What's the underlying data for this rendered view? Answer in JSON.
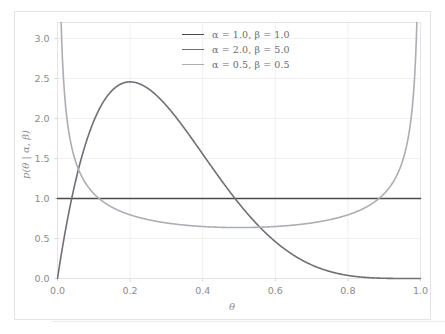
{
  "chart_data": {
    "type": "line",
    "title": "",
    "xlabel": "θ",
    "ylabel": "p(θ | α, β)",
    "xlim": [
      0.0,
      1.0
    ],
    "ylim": [
      0.0,
      3.2
    ],
    "xticks": [
      "0.0",
      "0.2",
      "0.4",
      "0.6",
      "0.8",
      "1.0"
    ],
    "xtick_values": [
      0.0,
      0.2,
      0.4,
      0.6,
      0.8,
      1.0
    ],
    "yticks": [
      "0.0",
      "0.5",
      "1.0",
      "1.5",
      "2.0",
      "2.5",
      "3.0"
    ],
    "ytick_values": [
      0.0,
      0.5,
      1.0,
      1.5,
      2.0,
      2.5,
      3.0
    ],
    "grid": true,
    "legend_position": "upper center",
    "series": [
      {
        "name": "α = 1.0, β = 1.0",
        "alpha": 1.0,
        "beta": 1.0,
        "color": "#4b4b4f",
        "peak_value": 1.0,
        "peak_x": null,
        "description": "uniform density, flat at 1.0 across [0,1]"
      },
      {
        "name": "α = 2.0, β = 5.0",
        "alpha": 2.0,
        "beta": 5.0,
        "color": "#6f6f76",
        "peak_value": 2.458,
        "peak_x": 0.2,
        "description": "right-skewed unimodal, mode at 0.2, decays to 0 at 1.0"
      },
      {
        "name": "α = 0.5, β = 0.5",
        "alpha": 0.5,
        "beta": 0.5,
        "color": "#abaeb3",
        "peak_value": 3.2,
        "peak_x": 0.5,
        "description": "arcsine U-shaped, minimum 0.637 at 0.5, diverges at 0 and 1"
      }
    ]
  },
  "legend": {
    "entries": [
      {
        "label": "α = 1.0, β = 1.0",
        "color": "#4b4b4f"
      },
      {
        "label": "α = 2.0, β = 5.0",
        "color": "#6f6f76"
      },
      {
        "label": "α = 0.5, β = 0.5",
        "color": "#abaeb3"
      }
    ]
  },
  "axes": {
    "x_title": "θ",
    "y_title": "p(θ | α, β)",
    "x_tick_labels": [
      "0.0",
      "0.2",
      "0.4",
      "0.6",
      "0.8",
      "1.0"
    ],
    "y_tick_labels": [
      "0.0",
      "0.5",
      "1.0",
      "1.5",
      "2.0",
      "2.5",
      "3.0"
    ]
  },
  "style": {
    "background": "#ffffff",
    "grid_color": "#f0f0f3",
    "frame_color": "#e4e4e6",
    "tick_text_color": "#8a8a90"
  }
}
